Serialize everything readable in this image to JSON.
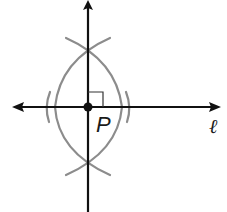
{
  "diagram": {
    "labels": {
      "point": "P",
      "line": "ℓ"
    },
    "colors": {
      "line": "#111111",
      "arc": "#8c8c8c",
      "background": "#ffffff"
    },
    "elements": {
      "line_l": {
        "type": "line-with-arrows",
        "from": [
          12,
          107
        ],
        "to": [
          220,
          107
        ]
      },
      "perpendicular": {
        "type": "ray-with-arrow",
        "from": [
          88,
          212
        ],
        "to": [
          88,
          2
        ]
      },
      "point_P": {
        "type": "point",
        "at": [
          88,
          107
        ]
      },
      "right_angle_mark": {
        "type": "square",
        "corner": [
          88,
          107
        ],
        "size": 15
      },
      "intersection_top": [
        88,
        47
      ],
      "intersection_bottom": [
        88,
        166
      ],
      "small_arcs": [
        "left of P near x=47",
        "right of P near x=130"
      ]
    }
  }
}
